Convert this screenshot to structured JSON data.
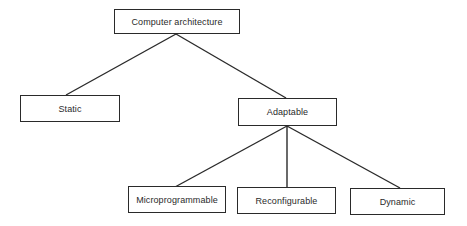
{
  "diagram": {
    "type": "tree",
    "root": {
      "id": "computer-architecture",
      "label": "Computer architecture",
      "children": [
        {
          "id": "static",
          "label": "Static",
          "children": []
        },
        {
          "id": "adaptable",
          "label": "Adaptable",
          "children": [
            {
              "id": "microprogrammable",
              "label": "Microprogrammable",
              "children": []
            },
            {
              "id": "reconfigurable",
              "label": "Reconfigurable",
              "children": []
            },
            {
              "id": "dynamic",
              "label": "Dynamic",
              "children": []
            }
          ]
        }
      ]
    },
    "nodes": {
      "root": "Computer architecture",
      "static": "Static",
      "adaptable": "Adaptable",
      "microprogrammable": "Microprogrammable",
      "reconfigurable": "Reconfigurable",
      "dynamic": "Dynamic"
    },
    "edges": [
      [
        "Computer architecture",
        "Static"
      ],
      [
        "Computer architecture",
        "Adaptable"
      ],
      [
        "Adaptable",
        "Microprogrammable"
      ],
      [
        "Adaptable",
        "Reconfigurable"
      ],
      [
        "Adaptable",
        "Dynamic"
      ]
    ],
    "colors": {
      "line": "#2a2a2a",
      "text": "#2a2a2a",
      "background": "#ffffff"
    }
  }
}
